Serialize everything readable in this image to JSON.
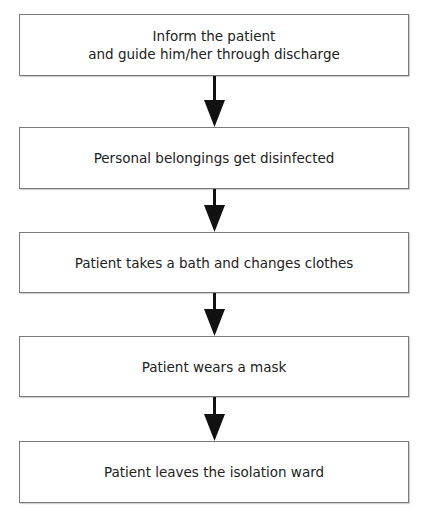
{
  "diagram": {
    "type": "flowchart",
    "direction": "top-to-bottom",
    "colors": {
      "box_border": "#7a7a7a",
      "box_fill": "#ffffff",
      "text": "#222222",
      "arrow": "#111111"
    },
    "steps": [
      {
        "id": 1,
        "lines": [
          "Inform the patient",
          "and guide him/her through discharge"
        ]
      },
      {
        "id": 2,
        "lines": [
          "Personal belongings get disinfected"
        ]
      },
      {
        "id": 3,
        "lines": [
          "Patient takes a bath and changes clothes"
        ]
      },
      {
        "id": 4,
        "lines": [
          "Patient wears a mask"
        ]
      },
      {
        "id": 5,
        "lines": [
          "Patient leaves the isolation ward"
        ]
      }
    ],
    "edges": [
      {
        "from": 1,
        "to": 2
      },
      {
        "from": 2,
        "to": 3
      },
      {
        "from": 3,
        "to": 4
      },
      {
        "from": 4,
        "to": 5
      }
    ]
  }
}
